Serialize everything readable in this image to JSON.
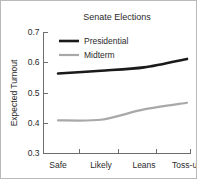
{
  "chart_data": {
    "type": "line",
    "title": "Senate Elections",
    "xlabel": "",
    "ylabel": "Expected Turnout",
    "categories": [
      "Safe",
      "Likely",
      "Leans",
      "Toss-up"
    ],
    "ylim": [
      0.3,
      0.7
    ],
    "yticks": [
      "0.3",
      "0.4",
      "0.5",
      "0.6",
      "0.7"
    ],
    "ytick_values": [
      0.3,
      0.4,
      0.5,
      0.6,
      0.7
    ],
    "grid": false,
    "legend_position": "upper-left-inside",
    "series": [
      {
        "name": "Presidential",
        "values": [
          0.563,
          0.572,
          0.583,
          0.611
        ],
        "color": "#1a1a1a",
        "width": 2.6
      },
      {
        "name": "Midterm",
        "values": [
          0.408,
          0.41,
          0.444,
          0.466
        ],
        "color": "#a8a8a8",
        "width": 2.2
      }
    ]
  },
  "colors": {
    "background": "#ffffff",
    "border": "#b9b9b9",
    "axis": "#6d6d6d",
    "text": "#2a2a2a",
    "presidential": "#1a1a1a",
    "midterm": "#a8a8a8"
  }
}
